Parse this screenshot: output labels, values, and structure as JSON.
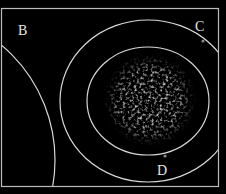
{
  "diagram": {
    "background": "#000000",
    "line_color": "#d8d8d8",
    "frame": {
      "x": 1.5,
      "y": 8.5,
      "width": 217,
      "height": 178
    },
    "arcs": [
      {
        "name": "arc-b",
        "cx": -95,
        "cy": 160,
        "r": 150
      },
      {
        "name": "outer-circle",
        "cx": 148,
        "cy": 101,
        "rx": 88,
        "ry": 81
      },
      {
        "name": "inner-circle",
        "cx": 148,
        "cy": 101,
        "rx": 61,
        "ry": 54
      }
    ],
    "cloud": {
      "cx": 150,
      "cy": 100,
      "r": 44,
      "color": "#9a9a9a"
    },
    "labels": [
      {
        "id": "B",
        "text": "B",
        "x": 18,
        "y": 24
      },
      {
        "id": "C",
        "text": "C",
        "x": 196,
        "y": 20
      },
      {
        "id": "D",
        "text": "D",
        "x": 158,
        "y": 164
      }
    ],
    "markers": [
      {
        "id": "C",
        "x": 203,
        "y": 41
      },
      {
        "id": "D",
        "x": 165,
        "y": 156
      }
    ]
  }
}
